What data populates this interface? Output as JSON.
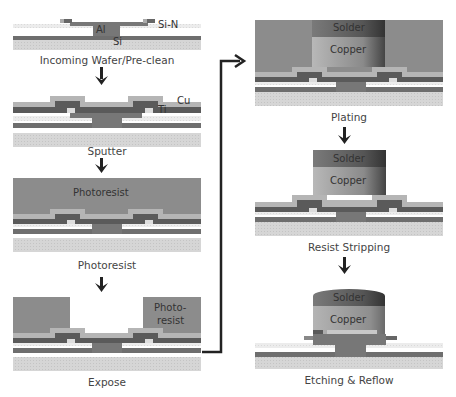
{
  "colors": {
    "si": "#d4d4d4",
    "si_dark_band": "#6e6e6e",
    "sin": "#e6e6e6",
    "al": "#777777",
    "ti": "#5a5a5a",
    "cu": "#b5b5b5",
    "photoresist": "#8c8c8c",
    "copper": "#a9a9a9",
    "solder": "#666666",
    "arrow": "#222222"
  },
  "stages": [
    {
      "id": "incoming",
      "label": "Incoming Wafer/Pre-clean",
      "layer_labels": [
        "Al",
        "Si-N",
        "Si"
      ]
    },
    {
      "id": "sputter",
      "label": "Sputter",
      "layer_labels": [
        "Cu",
        "Ti"
      ]
    },
    {
      "id": "photoresist",
      "label": "Photoresist",
      "layer_labels": [
        "Photoresist"
      ]
    },
    {
      "id": "expose",
      "label": "Expose",
      "layer_labels": [
        "Photo-",
        "resist"
      ]
    },
    {
      "id": "plating",
      "label": "Plating",
      "layer_labels": [
        "Solder",
        "Copper"
      ]
    },
    {
      "id": "resist-stripping",
      "label": "Resist Stripping",
      "layer_labels": [
        "Solder",
        "Copper"
      ]
    },
    {
      "id": "etching-reflow",
      "label": "Etching & Reflow",
      "layer_labels": [
        "Solder",
        "Copper"
      ]
    }
  ]
}
